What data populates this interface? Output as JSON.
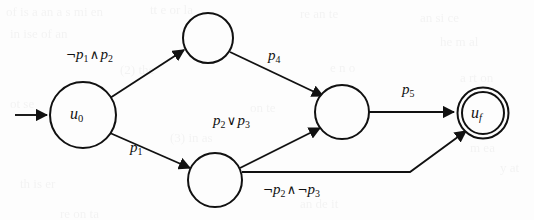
{
  "figure": {
    "type": "state-transition-diagram",
    "background_color": "#fdfdfd",
    "ink_color": "#111111",
    "width": 534,
    "height": 220
  },
  "states": [
    {
      "id": "u0",
      "label_main": "u",
      "label_sub": "0",
      "kind": "initial",
      "cx": 83,
      "cy": 115,
      "r": 33
    },
    {
      "id": "n1",
      "label_main": "",
      "label_sub": "",
      "kind": "normal",
      "cx": 208,
      "cy": 38,
      "r": 25
    },
    {
      "id": "n2",
      "label_main": "",
      "label_sub": "",
      "kind": "normal",
      "cx": 215,
      "cy": 180,
      "r": 27
    },
    {
      "id": "n3",
      "label_main": "",
      "label_sub": "",
      "kind": "normal",
      "cx": 342,
      "cy": 112,
      "r": 27
    },
    {
      "id": "uf",
      "label_main": "u",
      "label_sub": "f",
      "kind": "accepting",
      "cx": 483,
      "cy": 113,
      "r": 25
    }
  ],
  "start_marker": {
    "name": "start-arrow",
    "from_x": 15,
    "to_x": 49,
    "y": 115
  },
  "transitions": [
    {
      "id": "t1",
      "from": "u0",
      "to": "n1",
      "label_text": "¬p1 ∧ p2",
      "label_x": 66,
      "label_y": 52
    },
    {
      "id": "t2",
      "from": "n1",
      "to": "n3",
      "label_text": "p4",
      "label_x": 266,
      "label_y": 53
    },
    {
      "id": "t3",
      "from": "u0",
      "to": "n2",
      "label_text": "p1",
      "label_x": 128,
      "label_y": 145
    },
    {
      "id": "t4",
      "from": "n2",
      "to": "n3",
      "label_text": "p2 ∨ p3",
      "label_x": 213,
      "label_y": 118
    },
    {
      "id": "t5",
      "from": "n3",
      "to": "uf",
      "label_text": "p5",
      "label_x": 400,
      "label_y": 85
    },
    {
      "id": "t6",
      "from": "n2",
      "to": "uf",
      "label_text": "¬p2 ∧ ¬p3",
      "label_x": 262,
      "label_y": 181
    }
  ],
  "labels": {
    "t1": {
      "neg1": "¬",
      "p1": "p",
      "s1": "1",
      "op": "∧",
      "p2": "p",
      "s2": "2"
    },
    "t2": {
      "p": "p",
      "s": "4"
    },
    "t3": {
      "p": "p",
      "s": "1"
    },
    "t4": {
      "p1": "p",
      "s1": "2",
      "op": "∨",
      "p2": "p",
      "s2": "3"
    },
    "t5": {
      "p": "p",
      "s": "5"
    },
    "t6": {
      "neg1": "¬",
      "p1": "p",
      "s1": "2",
      "op": "∧",
      "neg2": "¬",
      "p2": "p",
      "s2": "3"
    }
  },
  "state_labels": {
    "u0": {
      "main": "u",
      "sub": "0"
    },
    "uf": {
      "main": "u",
      "sub": "f"
    }
  },
  "bleed_through": [
    {
      "text": "of is a an a  s  mi  en",
      "x": 6,
      "y": 4
    },
    {
      "text": "in  ise  of  an",
      "x": 10,
      "y": 26
    },
    {
      "text": "tt  e  or  la",
      "x": 150,
      "y": 2
    },
    {
      "text": "re  an  te",
      "x": 300,
      "y": 6
    },
    {
      "text": "an  si  ce",
      "x": 420,
      "y": 10
    },
    {
      "text": "he  m  al",
      "x": 440,
      "y": 34
    },
    {
      "text": "(2)   the",
      "x": 120,
      "y": 62
    },
    {
      "text": "e  n  o",
      "x": 330,
      "y": 60
    },
    {
      "text": "a  rt  on",
      "x": 460,
      "y": 70
    },
    {
      "text": "ot   se",
      "x": 10,
      "y": 96
    },
    {
      "text": "on  te",
      "x": 250,
      "y": 100
    },
    {
      "text": "(3)  in  as",
      "x": 170,
      "y": 130
    },
    {
      "text": "m  ea",
      "x": 470,
      "y": 140
    },
    {
      "text": "th  is  er",
      "x": 20,
      "y": 176
    },
    {
      "text": "an  de  it",
      "x": 300,
      "y": 196
    },
    {
      "text": "re  on  ta",
      "x": 60,
      "y": 206
    },
    {
      "text": "y  at",
      "x": 500,
      "y": 160
    }
  ]
}
